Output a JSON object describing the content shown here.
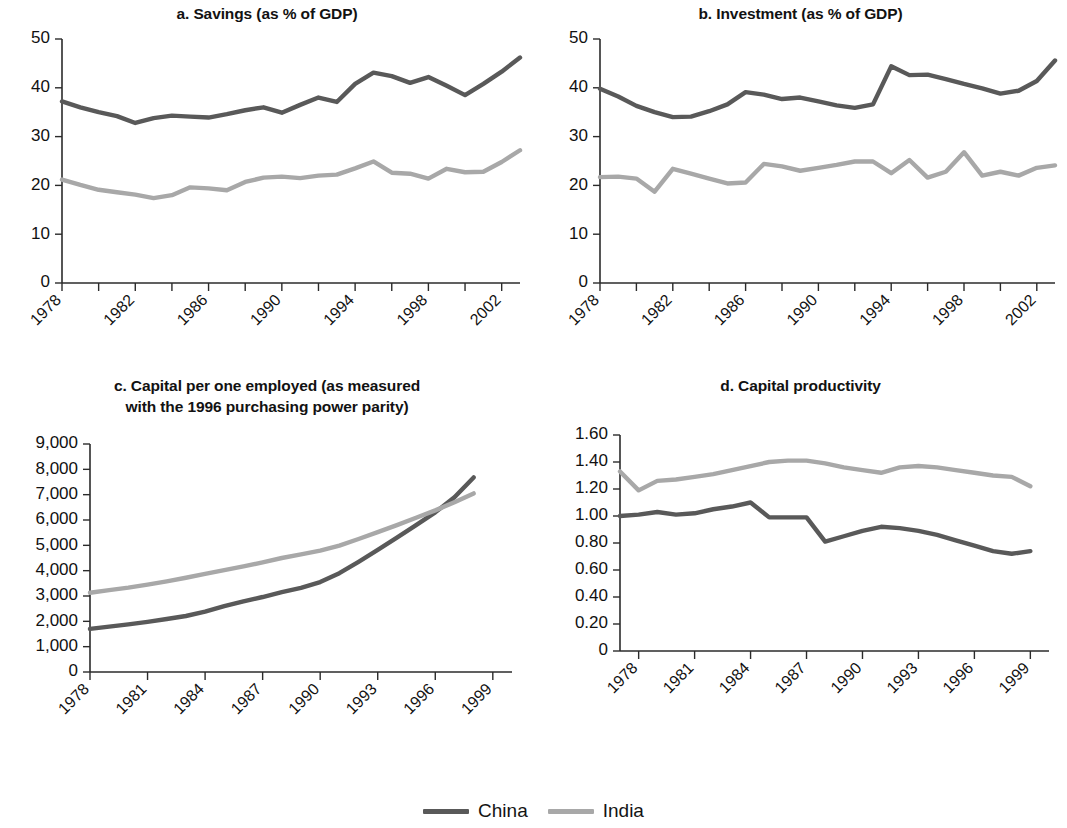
{
  "figure": {
    "background": "#ffffff",
    "legend": {
      "items": [
        {
          "label": "China",
          "color": "#595959"
        },
        {
          "label": "India",
          "color": "#a8a8a8"
        }
      ]
    }
  },
  "chart_data": [
    {
      "id": "panel-a",
      "type": "line",
      "title": "a. Savings (as % of GDP)",
      "xlabel": "",
      "ylabel": "",
      "xlim": [
        1978,
        2003
      ],
      "ylim": [
        0,
        50
      ],
      "yticks": [
        0,
        10,
        20,
        30,
        40,
        50
      ],
      "ytick_labels": [
        "0",
        "10",
        "20",
        "30",
        "40",
        "50"
      ],
      "xticks": [
        1978,
        1980,
        1982,
        1984,
        1986,
        1988,
        1990,
        1992,
        1994,
        1996,
        1998,
        2000,
        2002
      ],
      "xtick_labels": [
        "1978",
        "",
        "1982",
        "",
        "1986",
        "",
        "1990",
        "",
        "1994",
        "",
        "1998",
        "",
        "2002"
      ],
      "grid": false,
      "legend_position": "figure-bottom-center",
      "x": [
        1978,
        1979,
        1980,
        1981,
        1982,
        1983,
        1984,
        1985,
        1986,
        1987,
        1988,
        1989,
        1990,
        1991,
        1992,
        1993,
        1994,
        1995,
        1996,
        1997,
        1998,
        1999,
        2000,
        2001,
        2002,
        2003
      ],
      "series": [
        {
          "name": "China",
          "color": "#595959",
          "values": [
            37.2,
            36.0,
            35.0,
            34.2,
            32.8,
            33.8,
            34.3,
            34.1,
            33.9,
            34.6,
            35.4,
            36.0,
            34.9,
            36.5,
            38.0,
            37.1,
            40.8,
            43.1,
            42.4,
            41.0,
            42.2,
            40.4,
            38.5,
            40.8,
            43.3,
            46.2
          ]
        },
        {
          "name": "India",
          "color": "#a8a8a8",
          "values": [
            21.2,
            20.1,
            19.1,
            18.6,
            18.1,
            17.4,
            18.0,
            19.6,
            19.4,
            19.0,
            20.7,
            21.6,
            21.8,
            21.5,
            22.0,
            22.2,
            23.5,
            24.9,
            22.6,
            22.4,
            21.4,
            23.4,
            22.7,
            22.8,
            24.8,
            27.2
          ]
        }
      ]
    },
    {
      "id": "panel-b",
      "type": "line",
      "title": "b. Investment (as % of GDP)",
      "xlabel": "",
      "ylabel": "",
      "xlim": [
        1978,
        2003
      ],
      "ylim": [
        0,
        50
      ],
      "yticks": [
        0,
        10,
        20,
        30,
        40,
        50
      ],
      "ytick_labels": [
        "0",
        "10",
        "20",
        "30",
        "40",
        "50"
      ],
      "xticks": [
        1978,
        1980,
        1982,
        1984,
        1986,
        1988,
        1990,
        1992,
        1994,
        1996,
        1998,
        2000,
        2002
      ],
      "xtick_labels": [
        "1978",
        "",
        "1982",
        "",
        "1986",
        "",
        "1990",
        "",
        "1994",
        "",
        "1998",
        "",
        "2002"
      ],
      "grid": false,
      "legend_position": "figure-bottom-center",
      "x": [
        1978,
        1979,
        1980,
        1981,
        1982,
        1983,
        1984,
        1985,
        1986,
        1987,
        1988,
        1989,
        1990,
        1991,
        1992,
        1993,
        1994,
        1995,
        1996,
        1997,
        1998,
        1999,
        2000,
        2001,
        2002,
        2003
      ],
      "series": [
        {
          "name": "China",
          "color": "#595959",
          "values": [
            39.8,
            38.2,
            36.3,
            35.0,
            34.0,
            34.1,
            35.2,
            36.6,
            39.1,
            38.6,
            37.7,
            38.0,
            37.2,
            36.4,
            35.9,
            36.6,
            44.4,
            42.6,
            42.7,
            41.8,
            40.8,
            39.9,
            38.8,
            39.4,
            41.4,
            45.6
          ]
        },
        {
          "name": "India",
          "color": "#a8a8a8",
          "values": [
            21.7,
            21.8,
            21.4,
            18.7,
            23.4,
            22.4,
            21.4,
            20.4,
            20.6,
            24.4,
            23.9,
            23.0,
            23.6,
            24.2,
            24.9,
            24.9,
            22.5,
            25.2,
            21.6,
            22.8,
            26.8,
            22.0,
            22.8,
            22.0,
            23.6,
            24.1
          ]
        }
      ]
    },
    {
      "id": "panel-c",
      "type": "line",
      "title": "c. Capital per one employed (as measured\nwith the 1996 purchasing power parity)",
      "xlabel": "",
      "ylabel": "",
      "xlim": [
        1978,
        2000
      ],
      "ylim": [
        0,
        9000
      ],
      "yticks": [
        0,
        1000,
        2000,
        3000,
        4000,
        5000,
        6000,
        7000,
        8000,
        9000
      ],
      "ytick_labels": [
        "0",
        "1,000",
        "2,000",
        "3,000",
        "4,000",
        "5,000",
        "6,000",
        "7,000",
        "8,000",
        "9,000"
      ],
      "xticks": [
        1978,
        1981,
        1984,
        1987,
        1990,
        1993,
        1996,
        1999
      ],
      "xtick_labels": [
        "1978",
        "1981",
        "1984",
        "1987",
        "1990",
        "1993",
        "1996",
        "1999"
      ],
      "grid": false,
      "legend_position": "figure-bottom-center",
      "x": [
        1978,
        1979,
        1980,
        1981,
        1982,
        1983,
        1984,
        1985,
        1986,
        1987,
        1988,
        1989,
        1990,
        1991,
        1992,
        1993,
        1994,
        1995,
        1996,
        1997,
        1998
      ],
      "series": [
        {
          "name": "China",
          "color": "#595959",
          "values": [
            1700,
            1790,
            1880,
            1980,
            2090,
            2210,
            2380,
            2600,
            2790,
            2960,
            3150,
            3320,
            3550,
            3900,
            4350,
            4820,
            5300,
            5800,
            6300,
            6900,
            7680
          ]
        },
        {
          "name": "India",
          "color": "#a8a8a8",
          "values": [
            3130,
            3230,
            3330,
            3450,
            3580,
            3720,
            3870,
            4020,
            4170,
            4330,
            4500,
            4640,
            4790,
            4990,
            5250,
            5520,
            5800,
            6090,
            6380,
            6700,
            7050
          ]
        }
      ]
    },
    {
      "id": "panel-d",
      "type": "line",
      "title": "d. Capital productivity",
      "xlabel": "",
      "ylabel": "",
      "xlim": [
        1977,
        2000
      ],
      "ylim": [
        0,
        1.6
      ],
      "yticks": [
        0,
        0.2,
        0.4,
        0.6,
        0.8,
        1.0,
        1.2,
        1.4,
        1.6
      ],
      "ytick_labels": [
        "0",
        "0.20",
        "0.40",
        "0.60",
        "0.80",
        "1.00",
        "1.20",
        "1.40",
        "1.60"
      ],
      "xticks": [
        1978,
        1981,
        1984,
        1987,
        1990,
        1993,
        1996,
        1999
      ],
      "xtick_labels": [
        "1978",
        "1981",
        "1984",
        "1987",
        "1990",
        "1993",
        "1996",
        "1999"
      ],
      "grid": false,
      "legend_position": "figure-bottom-center",
      "x": [
        1977,
        1978,
        1979,
        1980,
        1981,
        1982,
        1983,
        1984,
        1985,
        1986,
        1987,
        1988,
        1989,
        1990,
        1991,
        1992,
        1993,
        1994,
        1995,
        1996,
        1997,
        1998,
        1999
      ],
      "series": [
        {
          "name": "China",
          "color": "#595959",
          "values": [
            1.0,
            1.01,
            1.03,
            1.01,
            1.02,
            1.05,
            1.07,
            1.1,
            0.99,
            0.99,
            0.99,
            0.81,
            0.85,
            0.89,
            0.92,
            0.91,
            0.89,
            0.86,
            0.82,
            0.78,
            0.74,
            0.72,
            0.74
          ]
        },
        {
          "name": "India",
          "color": "#a8a8a8",
          "values": [
            1.33,
            1.19,
            1.26,
            1.27,
            1.29,
            1.31,
            1.34,
            1.37,
            1.4,
            1.41,
            1.41,
            1.39,
            1.36,
            1.34,
            1.32,
            1.36,
            1.37,
            1.36,
            1.34,
            1.32,
            1.3,
            1.29,
            1.22
          ]
        }
      ]
    }
  ]
}
